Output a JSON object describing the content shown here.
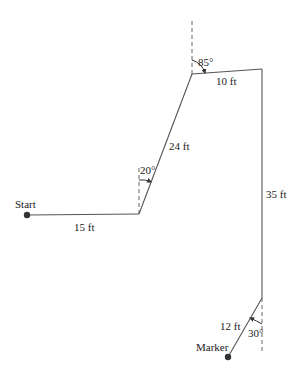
{
  "diagram": {
    "type": "path-displacement",
    "points": {
      "start": {
        "label": "Start",
        "x": 27,
        "y": 215
      },
      "p1": {
        "x": 139,
        "y": 214
      },
      "p2": {
        "x": 192,
        "y": 74
      },
      "p3": {
        "x": 262,
        "y": 69
      },
      "p4": {
        "x": 262,
        "y": 298
      },
      "marker": {
        "label": "Marker",
        "x": 228,
        "y": 357
      }
    },
    "segments": [
      {
        "id": "seg1",
        "label": "15 ft",
        "from": "start",
        "to": "p1"
      },
      {
        "id": "seg2",
        "label": "24 ft",
        "from": "p1",
        "to": "p2"
      },
      {
        "id": "seg3",
        "label": "10 ft",
        "from": "p2",
        "to": "p3"
      },
      {
        "id": "seg4",
        "label": "35 ft",
        "from": "p3",
        "to": "p4"
      },
      {
        "id": "seg5",
        "label": "12 ft",
        "from": "p4",
        "to": "marker"
      }
    ],
    "angles": [
      {
        "id": "angle1",
        "label": "20°",
        "at": "p1"
      },
      {
        "id": "angle2",
        "label": "85°",
        "at": "p2"
      },
      {
        "id": "angle3",
        "label": "30°",
        "at": "p4"
      }
    ],
    "colors": {
      "line": "#555555",
      "dashed": "#666666",
      "dot": "#333333",
      "text": "#222222"
    }
  }
}
